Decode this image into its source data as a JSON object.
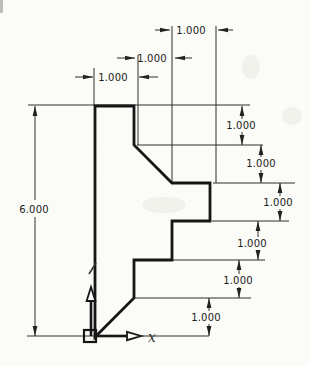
{
  "drawing": {
    "kind": "2D stepped part profile with linear dimensions",
    "dim_overall_height": "6.000",
    "dim_top": [
      "1.000",
      "1.000",
      "1.000"
    ],
    "dim_right": [
      "1.000",
      "1.000",
      "1.000",
      "1.000",
      "1.000",
      "1.000"
    ],
    "axis_x_label": "x",
    "colors": {
      "paper": "#fbfbf8",
      "profile_line": "#161616",
      "dimension_line": "#2e2e2e",
      "text": "#1a1a1a"
    },
    "profile_vertices_units": [
      [
        0,
        0
      ],
      [
        0,
        6
      ],
      [
        1,
        6
      ],
      [
        1,
        5
      ],
      [
        2,
        4
      ],
      [
        3,
        4
      ],
      [
        3,
        3
      ],
      [
        2,
        3
      ],
      [
        2,
        2
      ],
      [
        1,
        2
      ],
      [
        1,
        1
      ]
    ]
  }
}
